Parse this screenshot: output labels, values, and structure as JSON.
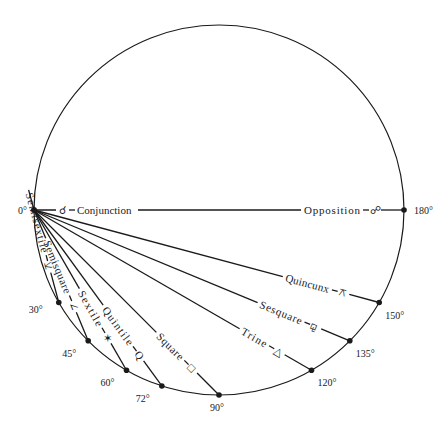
{
  "diagram": {
    "circle": {
      "cx": 219,
      "cy": 210,
      "r": 185,
      "stroke": "#1a1a1a"
    },
    "origin_label": "0°",
    "aspects": [
      {
        "name": "Conjunction",
        "angle": 0,
        "symbol": "☌",
        "degree_label": "0°"
      },
      {
        "name": "Semisextile",
        "angle": 30,
        "symbol": "⚺",
        "degree_label": "30°"
      },
      {
        "name": "Semisquare",
        "angle": 45,
        "symbol": "∠",
        "degree_label": "45°"
      },
      {
        "name": "Sextile",
        "angle": 60,
        "symbol": "✶",
        "degree_label": "60°"
      },
      {
        "name": "Quintile",
        "angle": 72,
        "symbol": "Q",
        "degree_label": "72°"
      },
      {
        "name": "Square",
        "angle": 90,
        "symbol": "□",
        "degree_label": "90°"
      },
      {
        "name": "Trine",
        "angle": 120,
        "symbol": "△",
        "degree_label": "120°"
      },
      {
        "name": "Sesquare",
        "angle": 135,
        "symbol": "⚼",
        "degree_label": "135°"
      },
      {
        "name": "Quincunx",
        "angle": 150,
        "symbol": "⚻",
        "degree_label": "150°"
      },
      {
        "name": "Opposition",
        "angle": 180,
        "symbol": "☍",
        "degree_label": "180°"
      }
    ]
  }
}
